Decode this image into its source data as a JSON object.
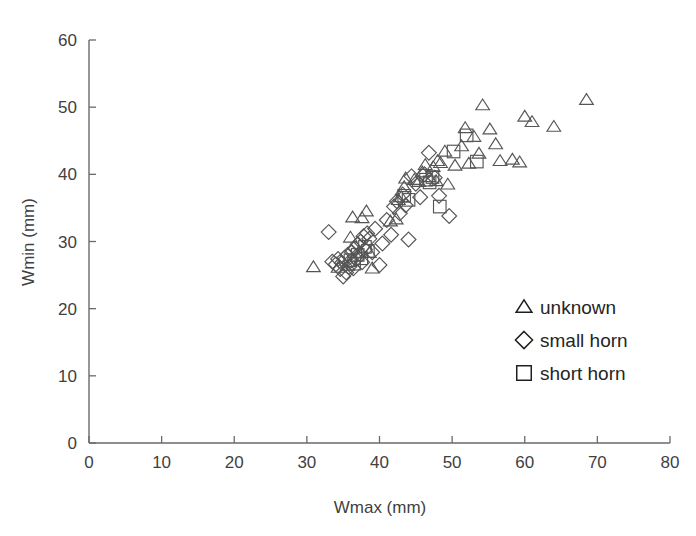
{
  "chart_data": {
    "type": "scatter",
    "title": "",
    "xlabel": "Wmax (mm)",
    "ylabel": "Wmin (mm)",
    "xlim": [
      0,
      80
    ],
    "ylim": [
      0,
      60
    ],
    "xticks": [
      0,
      10,
      20,
      30,
      40,
      50,
      60,
      70,
      80
    ],
    "yticks": [
      0,
      10,
      20,
      30,
      40,
      50,
      60
    ],
    "grid": false,
    "legend_position": "center-right",
    "series": [
      {
        "name": "unknown",
        "marker": "triangle",
        "points": [
          [
            30.9,
            26.2
          ],
          [
            34.3,
            26.1
          ],
          [
            35.6,
            26.4
          ],
          [
            36.0,
            30.6
          ],
          [
            36.3,
            33.6
          ],
          [
            37.6,
            33.5
          ],
          [
            38.2,
            34.5
          ],
          [
            38.6,
            28.3
          ],
          [
            39.0,
            26.0
          ],
          [
            41.5,
            33.0
          ],
          [
            42.3,
            33.3
          ],
          [
            42.6,
            36.2
          ],
          [
            43.0,
            36.6
          ],
          [
            43.4,
            38.1
          ],
          [
            43.6,
            39.4
          ],
          [
            44.8,
            39.2
          ],
          [
            45.4,
            38.9
          ],
          [
            45.9,
            40.3
          ],
          [
            46.3,
            41.4
          ],
          [
            46.8,
            39.6
          ],
          [
            47.4,
            41.1
          ],
          [
            47.8,
            39.0
          ],
          [
            48.0,
            42.0
          ],
          [
            48.4,
            41.7
          ],
          [
            49.0,
            43.4
          ],
          [
            49.4,
            38.5
          ],
          [
            50.4,
            41.3
          ],
          [
            51.3,
            44.2
          ],
          [
            51.8,
            46.9
          ],
          [
            52.3,
            41.6
          ],
          [
            53.0,
            45.6
          ],
          [
            53.7,
            43.1
          ],
          [
            54.2,
            50.3
          ],
          [
            55.2,
            46.7
          ],
          [
            56.0,
            44.5
          ],
          [
            56.6,
            42.0
          ],
          [
            58.3,
            42.2
          ],
          [
            59.3,
            41.8
          ],
          [
            60.0,
            48.6
          ],
          [
            61.0,
            47.8
          ],
          [
            64.0,
            47.1
          ],
          [
            68.5,
            51.1
          ]
        ]
      },
      {
        "name": "small horn",
        "marker": "diamond",
        "points": [
          [
            33.0,
            31.4
          ],
          [
            33.5,
            27.0
          ],
          [
            34.0,
            26.6
          ],
          [
            34.3,
            27.4
          ],
          [
            34.6,
            25.9
          ],
          [
            34.8,
            26.8
          ],
          [
            35.0,
            24.8
          ],
          [
            35.2,
            27.6
          ],
          [
            35.4,
            25.4
          ],
          [
            35.6,
            28.0
          ],
          [
            35.8,
            26.2
          ],
          [
            36.0,
            27.1
          ],
          [
            36.2,
            28.4
          ],
          [
            36.4,
            26.0
          ],
          [
            36.6,
            29.0
          ],
          [
            36.8,
            27.4
          ],
          [
            37.0,
            29.6
          ],
          [
            37.2,
            28.2
          ],
          [
            37.4,
            30.0
          ],
          [
            37.6,
            26.9
          ],
          [
            37.8,
            30.8
          ],
          [
            38.0,
            28.8
          ],
          [
            38.3,
            31.2
          ],
          [
            38.6,
            30.4
          ],
          [
            39.0,
            28.4
          ],
          [
            39.4,
            31.9
          ],
          [
            40.0,
            26.5
          ],
          [
            40.4,
            29.7
          ],
          [
            41.0,
            33.2
          ],
          [
            41.6,
            31.0
          ],
          [
            42.0,
            35.2
          ],
          [
            42.4,
            36.0
          ],
          [
            42.8,
            34.2
          ],
          [
            43.2,
            37.0
          ],
          [
            43.6,
            35.4
          ],
          [
            44.0,
            30.3
          ],
          [
            44.4,
            39.7
          ],
          [
            45.0,
            38.6
          ],
          [
            45.6,
            36.6
          ],
          [
            46.2,
            40.0
          ],
          [
            46.8,
            43.2
          ],
          [
            47.6,
            39.5
          ],
          [
            48.2,
            36.8
          ],
          [
            49.6,
            33.8
          ]
        ]
      },
      {
        "name": "short horn",
        "marker": "square",
        "points": [
          [
            36.0,
            27.2
          ],
          [
            36.5,
            26.7
          ],
          [
            37.0,
            28.0
          ],
          [
            37.5,
            27.5
          ],
          [
            38.0,
            29.2
          ],
          [
            38.4,
            28.6
          ],
          [
            43.4,
            36.8
          ],
          [
            44.0,
            36.2
          ],
          [
            46.4,
            39.2
          ],
          [
            46.9,
            38.8
          ],
          [
            47.3,
            39.6
          ],
          [
            48.3,
            35.2
          ],
          [
            50.2,
            43.4
          ],
          [
            52.0,
            45.8
          ],
          [
            53.4,
            41.9
          ]
        ]
      }
    ]
  },
  "axes": {
    "x_title": "Wmax (mm)",
    "y_title": "Wmin (mm)",
    "x_tick_labels": [
      "0",
      "10",
      "20",
      "30",
      "40",
      "50",
      "60",
      "70",
      "80"
    ],
    "y_tick_labels": [
      "0",
      "10",
      "20",
      "30",
      "40",
      "50",
      "60"
    ]
  },
  "legend": {
    "entries": [
      {
        "label": "unknown",
        "marker": "triangle-icon"
      },
      {
        "label": "small horn",
        "marker": "diamond-icon"
      },
      {
        "label": "short horn",
        "marker": "square-icon"
      }
    ]
  },
  "colors": {
    "marker_stroke": "#555555",
    "axis": "#6a6a6a",
    "text": "#3f3f3f",
    "background": "#ffffff"
  }
}
